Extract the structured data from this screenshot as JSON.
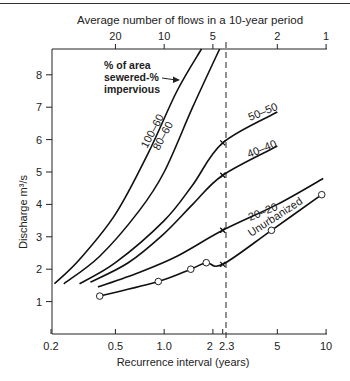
{
  "chart_data": {
    "type": "line",
    "title": "",
    "xlabel": "Recurrence interval (years)",
    "ylabel": "Discharge m³/s",
    "x2label": "Average number of flows in a 10-year period",
    "xscale": "log",
    "xlim": [
      0.2,
      10
    ],
    "ylim": [
      0,
      8.8
    ],
    "x_ticks": [
      {
        "v": 0.2,
        "label": "0.2"
      },
      {
        "v": 0.5,
        "label": "0.5"
      },
      {
        "v": 1.0,
        "label": "1.0"
      },
      {
        "v": 2,
        "label": "2"
      },
      {
        "v": 2.3,
        "label": "2.3"
      },
      {
        "v": 5,
        "label": "5"
      },
      {
        "v": 10,
        "label": "10"
      }
    ],
    "x2_ticks": [
      {
        "v": 0.5,
        "label": "20"
      },
      {
        "v": 1.0,
        "label": "10"
      },
      {
        "v": 2,
        "label": "5"
      },
      {
        "v": 5,
        "label": "2"
      },
      {
        "v": 10,
        "label": "1"
      }
    ],
    "y_ticks": [
      1,
      2,
      3,
      4,
      5,
      6,
      7,
      8
    ],
    "grid": false,
    "reference_line": {
      "x": 2.3,
      "style": "dashed"
    },
    "legend_annotation": "% of area sewered-% impervious",
    "series": [
      {
        "name": "100-60",
        "x": [
          0.21,
          0.3,
          0.5,
          0.8,
          1.2,
          1.7
        ],
        "y": [
          1.55,
          2.3,
          3.7,
          5.6,
          7.5,
          8.8
        ],
        "markers": []
      },
      {
        "name": "80-60",
        "x": [
          0.24,
          0.4,
          0.7,
          1.0,
          1.5,
          2.2
        ],
        "y": [
          1.55,
          2.4,
          3.8,
          5.0,
          7.0,
          8.8
        ],
        "markers": []
      },
      {
        "name": "50-50",
        "x": [
          0.3,
          0.5,
          1.0,
          1.5,
          2.3,
          5.0
        ],
        "y": [
          1.55,
          2.2,
          3.5,
          4.6,
          5.9,
          6.85
        ],
        "markers": [
          {
            "x": 2.3,
            "y": 5.9,
            "symbol": "x"
          }
        ]
      },
      {
        "name": "40-40",
        "x": [
          0.35,
          0.6,
          1.0,
          1.5,
          2.3,
          5.0
        ],
        "y": [
          1.6,
          2.2,
          3.1,
          4.0,
          4.9,
          5.8
        ],
        "markers": [
          {
            "x": 2.3,
            "y": 4.9,
            "symbol": "x"
          }
        ]
      },
      {
        "name": "20-20",
        "x": [
          0.39,
          0.7,
          1.2,
          2.3,
          5.0,
          9.6
        ],
        "y": [
          1.45,
          1.9,
          2.4,
          3.2,
          4.0,
          4.8
        ],
        "markers": [
          {
            "x": 2.3,
            "y": 3.2,
            "symbol": "x"
          }
        ]
      },
      {
        "name": "Unurbanized",
        "x": [
          0.4,
          0.92,
          1.46,
          1.82,
          2.3,
          4.6,
          9.4
        ],
        "y": [
          1.17,
          1.62,
          2.0,
          2.2,
          2.15,
          3.2,
          4.3
        ],
        "markers": [
          {
            "x": 0.4,
            "y": 1.17,
            "symbol": "o"
          },
          {
            "x": 0.92,
            "y": 1.62,
            "symbol": "o"
          },
          {
            "x": 1.46,
            "y": 2.0,
            "symbol": "o"
          },
          {
            "x": 1.82,
            "y": 2.2,
            "symbol": "o"
          },
          {
            "x": 2.3,
            "y": 2.15,
            "symbol": "x"
          },
          {
            "x": 4.6,
            "y": 3.2,
            "symbol": "o"
          },
          {
            "x": 9.4,
            "y": 4.3,
            "symbol": "o"
          }
        ]
      }
    ]
  },
  "labels": {
    "x2label": "Average number of flows in a 10-year period",
    "xlabel": "Recurrence interval (years)",
    "ylabel": "Discharge m³/s",
    "annotation_line1": "% of area",
    "annotation_line2": "sewered-%",
    "annotation_line3": "impervious",
    "curve_100_60": "100–60",
    "curve_80_60": "80–60",
    "curve_50_50": "50–50",
    "curve_40_40": "40–40",
    "curve_20_20": "20–20",
    "curve_unurbanized": "Unurbanized"
  }
}
